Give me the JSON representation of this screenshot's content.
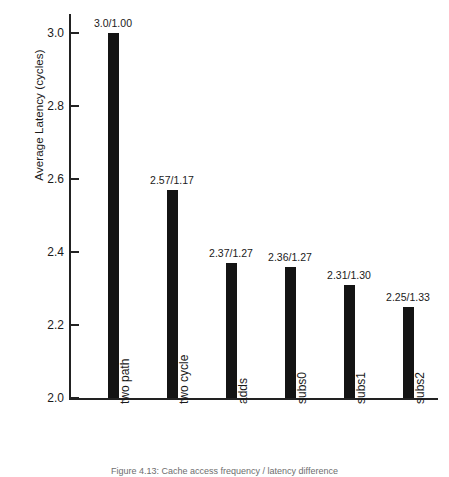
{
  "chart_data": {
    "type": "bar",
    "title": "",
    "xlabel": "",
    "ylabel": "Average Latency (cycles)",
    "ylim": [
      2.0,
      3.0
    ],
    "yticks": [
      "2.0",
      "2.2",
      "2.4",
      "2.6",
      "2.8",
      "3.0"
    ],
    "grid": false,
    "legend": "none",
    "bar_color": "#141414",
    "categories": [
      "two path",
      "two cycle",
      "adds",
      "subs0",
      "subs1",
      "subs2"
    ],
    "values": [
      3.0,
      2.57,
      2.37,
      2.36,
      2.31,
      2.25
    ],
    "speedups": [
      1.0,
      1.17,
      1.27,
      1.27,
      1.3,
      1.33
    ],
    "data_labels": [
      "3.0/1.00",
      "2.57/1.17",
      "2.37/1.27",
      "2.36/1.27",
      "2.31/1.30",
      "2.25/1.33"
    ]
  },
  "caption": {
    "text": "Figure 4.13: Cache access frequency / latency difference"
  }
}
